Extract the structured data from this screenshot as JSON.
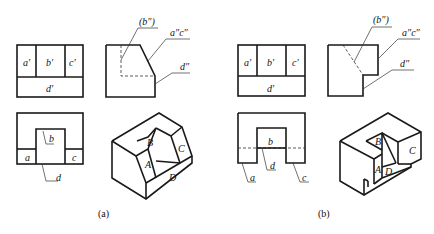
{
  "figure": {
    "panel_a": {
      "caption": "(a)",
      "front_view": {
        "labels": {
          "a": "a′",
          "b": "b′",
          "c": "c′",
          "d": "d′"
        }
      },
      "side_view": {
        "labels": {
          "b": "(b″)",
          "ac": "a″c″",
          "d": "d″"
        }
      },
      "top_view": {
        "labels": {
          "a": "a",
          "b": "b",
          "c": "c",
          "d": "d"
        }
      },
      "isometric": {
        "labels": {
          "A": "A",
          "B": "B",
          "C": "C",
          "D": "D"
        }
      }
    },
    "panel_b": {
      "caption": "(b)",
      "front_view": {
        "labels": {
          "a": "a′",
          "b": "b′",
          "c": "c′",
          "d": "d′"
        }
      },
      "side_view": {
        "labels": {
          "b": "(b″)",
          "ac": "a″c″",
          "d": "d″"
        }
      },
      "top_view": {
        "labels": {
          "a": "a",
          "b": "b",
          "c": "c",
          "d": "d"
        }
      },
      "isometric": {
        "labels": {
          "A": "A",
          "B": "B",
          "C": "C",
          "D": "D"
        }
      }
    }
  }
}
